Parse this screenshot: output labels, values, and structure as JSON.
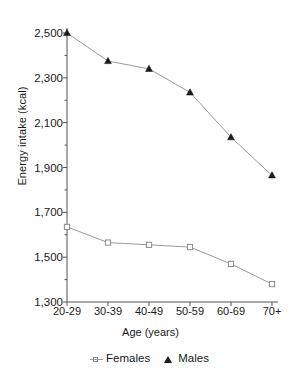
{
  "chart_data": {
    "type": "line",
    "title": "",
    "xlabel": "Age (years)",
    "ylabel": "Energy intake (kcal)",
    "categories": [
      "20-29",
      "30-39",
      "40-49",
      "50-59",
      "60-69",
      "70+"
    ],
    "series": [
      {
        "name": "Females",
        "values": [
          1635,
          1565,
          1555,
          1545,
          1470,
          1380
        ],
        "marker": "open-square",
        "color": "#9a9a9a"
      },
      {
        "name": "Males",
        "values": [
          2500,
          2375,
          2340,
          2235,
          2035,
          1865
        ],
        "marker": "filled-triangle",
        "color": "#1a1a1a"
      }
    ],
    "ylim": [
      1300,
      2500
    ],
    "yticks": [
      1300,
      1500,
      1700,
      1900,
      2100,
      2300,
      2500
    ],
    "ytick_labels": [
      "1,300",
      "1,500",
      "1,700",
      "1,900",
      "2,100",
      "2,300",
      "2,500"
    ],
    "minor_ytick_step": 100,
    "grid": false,
    "legend_position": "bottom"
  },
  "legend": {
    "items": [
      {
        "label": "Females",
        "marker": "open-square-marker"
      },
      {
        "label": "Males",
        "marker": "filled-triangle-marker"
      }
    ]
  }
}
